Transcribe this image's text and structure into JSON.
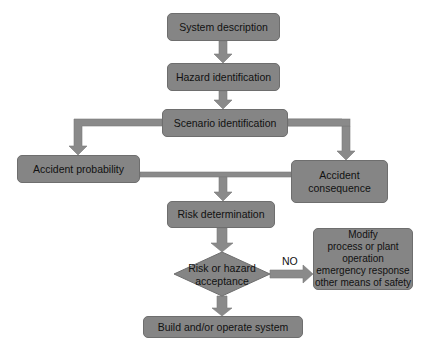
{
  "diagram": {
    "type": "flowchart",
    "fill_color": "#858585",
    "arrow_color": "#8a8a8a",
    "nodes": {
      "system_description": {
        "label": "System description",
        "shape": "rounded-rect"
      },
      "hazard_identification": {
        "label": "Hazard identification",
        "shape": "rounded-rect"
      },
      "scenario_identification": {
        "label": "Scenario identification",
        "shape": "rounded-rect"
      },
      "accident_probability": {
        "label": "Accident probability",
        "shape": "rounded-rect"
      },
      "accident_consequence": {
        "lines": [
          "Accident",
          "consequence"
        ],
        "shape": "rounded-rect"
      },
      "risk_determination": {
        "label": "Risk determination",
        "shape": "rounded-rect"
      },
      "risk_acceptance": {
        "lines": [
          "Risk or hazard",
          "acceptance"
        ],
        "shape": "diamond"
      },
      "modify": {
        "lines": [
          "Modify",
          "process or plant",
          "operation",
          "emergency response",
          "other means of safety"
        ],
        "shape": "rounded-rect"
      },
      "build_operate": {
        "label": "Build and/or operate system",
        "shape": "rounded-rect"
      }
    },
    "edges": [
      {
        "from": "System description",
        "to": "Hazard identification"
      },
      {
        "from": "Hazard identification",
        "to": "Scenario identification"
      },
      {
        "from": "Scenario identification",
        "to": "Accident probability"
      },
      {
        "from": "Scenario identification",
        "to": "Accident consequence"
      },
      {
        "from": "Accident probability + Accident consequence",
        "to": "Risk determination"
      },
      {
        "from": "Risk determination",
        "to": "Risk or hazard acceptance"
      },
      {
        "from": "Risk or hazard acceptance",
        "to": "Modify",
        "label": "NO"
      },
      {
        "from": "Risk or hazard acceptance",
        "to": "Build and/or operate system"
      }
    ],
    "edge_labels": {
      "no": "NO"
    }
  }
}
